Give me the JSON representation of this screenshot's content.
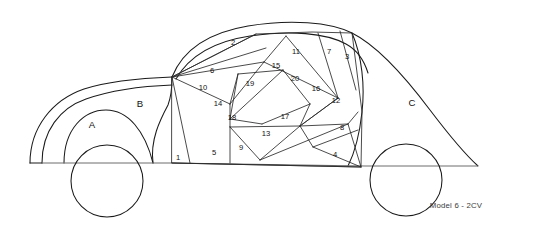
{
  "figure": {
    "caption": "Model 6 - 2CV",
    "title": "Model 6 - 2CV",
    "line_color": "#1a1a1a",
    "ground_color": "#6d6d6d",
    "background": "#ffffff",
    "text_color": "#111111"
  },
  "regions": {
    "letters": [
      {
        "label": "A",
        "x": 92,
        "y": 125,
        "note": "front wheel arch"
      },
      {
        "label": "B",
        "x": 140,
        "y": 104,
        "note": "front hood / bonnet"
      },
      {
        "label": "C",
        "x": 412,
        "y": 103,
        "note": "rear body / trunk"
      }
    ],
    "numbers": [
      {
        "label": "1",
        "x": 178,
        "y": 158
      },
      {
        "label": "2",
        "x": 233,
        "y": 43
      },
      {
        "label": "3",
        "x": 347,
        "y": 57
      },
      {
        "label": "4",
        "x": 335,
        "y": 155
      },
      {
        "label": "5",
        "x": 214,
        "y": 153
      },
      {
        "label": "6",
        "x": 212,
        "y": 71
      },
      {
        "label": "7",
        "x": 329,
        "y": 52
      },
      {
        "label": "8",
        "x": 342,
        "y": 128
      },
      {
        "label": "9",
        "x": 241,
        "y": 148
      },
      {
        "label": "10",
        "x": 203,
        "y": 88
      },
      {
        "label": "11",
        "x": 296,
        "y": 52
      },
      {
        "label": "12",
        "x": 336,
        "y": 101
      },
      {
        "label": "13",
        "x": 266,
        "y": 134
      },
      {
        "label": "14",
        "x": 218,
        "y": 104
      },
      {
        "label": "15",
        "x": 276,
        "y": 66
      },
      {
        "label": "16",
        "x": 316,
        "y": 89
      },
      {
        "label": "17",
        "x": 285,
        "y": 117
      },
      {
        "label": "18",
        "x": 232,
        "y": 118
      },
      {
        "label": "19",
        "x": 250,
        "y": 84
      },
      {
        "label": "20",
        "x": 295,
        "y": 79
      }
    ]
  },
  "counts": {
    "numbered_regions": 20,
    "lettered_regions": 3,
    "wheels": 2
  }
}
